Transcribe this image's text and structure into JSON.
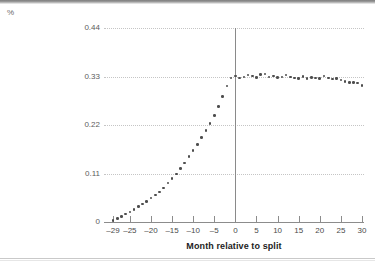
{
  "figure": {
    "unit_label": "%",
    "background_color": "#ffffff",
    "marker_color": "#4d4d4d",
    "gridline_color": "#c5c5c5",
    "axis_color": "#8c8c8c"
  },
  "chart_data": {
    "type": "scatter",
    "title": "",
    "xlabel": "Month relative to split",
    "ylabel": "%",
    "ylim": [
      0,
      0.44
    ],
    "xlim": [
      -29,
      30
    ],
    "grid": true,
    "legend": null,
    "yticks": [
      0,
      0.11,
      0.22,
      0.33,
      0.44
    ],
    "ytick_labels": [
      "0",
      "0.11",
      "0.22",
      "0.33",
      "0.44"
    ],
    "xticks": [
      -29,
      -25,
      -20,
      -15,
      -10,
      -5,
      0,
      5,
      10,
      15,
      20,
      25,
      30
    ],
    "xtick_labels": [
      "–29",
      "–25",
      "–20",
      "–15",
      "–10",
      "–5",
      "0",
      "5",
      "10",
      "15",
      "20",
      "25",
      "30"
    ],
    "annotations": [
      {
        "type": "vertical-line",
        "x": 0,
        "label": "split month reference line"
      }
    ],
    "x": [
      -29,
      -28,
      -27,
      -26,
      -25,
      -24,
      -23,
      -22,
      -21,
      -20,
      -19,
      -18,
      -17,
      -16,
      -15,
      -14,
      -13,
      -12,
      -11,
      -10,
      -9,
      -8,
      -7,
      -6,
      -5,
      -4,
      -3,
      -2,
      -1,
      0,
      1,
      2,
      3,
      4,
      5,
      6,
      7,
      8,
      9,
      10,
      11,
      12,
      13,
      14,
      15,
      16,
      17,
      18,
      19,
      20,
      21,
      22,
      23,
      24,
      25,
      26,
      27,
      28,
      29,
      30
    ],
    "values": [
      0.004,
      0.008,
      0.013,
      0.018,
      0.023,
      0.029,
      0.035,
      0.041,
      0.047,
      0.054,
      0.061,
      0.068,
      0.077,
      0.088,
      0.099,
      0.109,
      0.122,
      0.134,
      0.148,
      0.162,
      0.176,
      0.191,
      0.207,
      0.223,
      0.241,
      0.262,
      0.285,
      0.308,
      0.327,
      0.331,
      0.327,
      0.329,
      0.333,
      0.331,
      0.328,
      0.334,
      0.336,
      0.329,
      0.331,
      0.328,
      0.329,
      0.333,
      0.329,
      0.327,
      0.326,
      0.33,
      0.326,
      0.328,
      0.327,
      0.325,
      0.331,
      0.327,
      0.324,
      0.325,
      0.322,
      0.318,
      0.317,
      0.316,
      0.315,
      0.309
    ]
  }
}
